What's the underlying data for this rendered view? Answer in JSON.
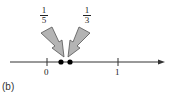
{
  "figure": {
    "panel_label": "(b)",
    "number_line": {
      "ticks": [
        {
          "value": 0,
          "label": "0"
        },
        {
          "value": 1,
          "label": "1"
        }
      ],
      "points": [
        {
          "value": "1/5",
          "numerator": "1",
          "denominator": "5"
        },
        {
          "value": "1/3",
          "numerator": "1",
          "denominator": "3"
        }
      ]
    },
    "colors": {
      "arrow_fill": "#b4b4b4",
      "arrow_stroke": "#555555",
      "axis": "#333333",
      "point": "#000000"
    }
  }
}
